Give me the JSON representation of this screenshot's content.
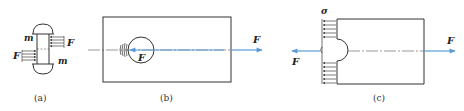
{
  "figure": {
    "panels": [
      {
        "id": "a",
        "caption": "(a)",
        "labels": {
          "m_top": "m",
          "m_bottom": "m",
          "F_right": "F",
          "F_left": "F"
        }
      },
      {
        "id": "b",
        "caption": "(b)",
        "labels": {
          "F_inner": "F",
          "F_right": "F"
        }
      },
      {
        "id": "c",
        "caption": "(c)",
        "labels": {
          "sigma": "σ",
          "F_left": "F",
          "F_right": "F"
        }
      }
    ],
    "colors": {
      "line": "#333333",
      "force_arrow": "#5b9bd5",
      "background": "#ffffff"
    }
  }
}
